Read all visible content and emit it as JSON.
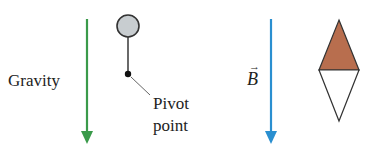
{
  "left_panel": {
    "gravity_label": "Gravity",
    "pivot_label_line1": "Pivot",
    "pivot_label_line2": "point",
    "arrow_color": "#3a9a4a",
    "ball_fill": "#c8cdd0"
  },
  "right_panel": {
    "field_label": "B",
    "field_vector_arrow": "→",
    "arrow_color": "#2a8fd0",
    "needle_north_color": "#b86e4e",
    "needle_south_color": "#ffffff"
  }
}
